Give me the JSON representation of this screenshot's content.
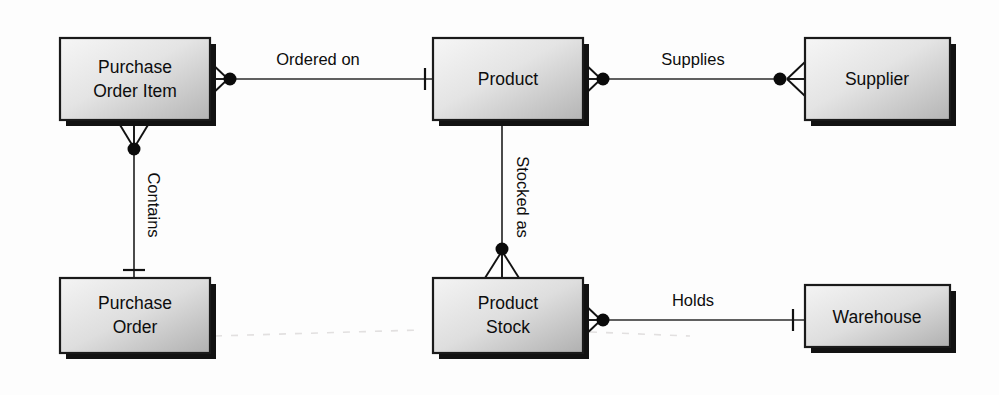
{
  "diagram": {
    "notation": "crow's foot",
    "background_color": "#fdfdfd",
    "entity_fill_light": "#f2f2f2",
    "entity_fill_dark": "#b8b8b8",
    "line_color": "#2b2b2b",
    "text_color": "#0d0d0d"
  },
  "entities": [
    {
      "id": "purchase-order-item",
      "label_lines": [
        "Purchase",
        "Order Item"
      ],
      "line1": "Purchase",
      "line2": "Order Item",
      "x": 60,
      "y": 38,
      "w": 150,
      "h": 82
    },
    {
      "id": "product",
      "label_lines": [
        "Product"
      ],
      "line1": "Product",
      "line2": "",
      "x": 433,
      "y": 38,
      "w": 150,
      "h": 82
    },
    {
      "id": "supplier",
      "label_lines": [
        "Supplier"
      ],
      "line1": "Supplier",
      "line2": "",
      "x": 805,
      "y": 38,
      "w": 145,
      "h": 82
    },
    {
      "id": "purchase-order",
      "label_lines": [
        "Purchase",
        "Order"
      ],
      "line1": "Purchase",
      "line2": "Order",
      "x": 60,
      "y": 278,
      "w": 150,
      "h": 75
    },
    {
      "id": "product-stock",
      "label_lines": [
        "Product",
        "Stock"
      ],
      "line1": "Product",
      "line2": "Stock",
      "x": 433,
      "y": 278,
      "w": 150,
      "h": 75
    },
    {
      "id": "warehouse",
      "label_lines": [
        "Warehouse"
      ],
      "line1": "Warehouse",
      "line2": "",
      "x": 805,
      "y": 285,
      "w": 145,
      "h": 62
    }
  ],
  "relationships": [
    {
      "id": "ordered-on",
      "label": "Ordered on",
      "from": "purchase-order-item",
      "to": "product",
      "orientation": "horizontal",
      "from_cardinality": "many-optional",
      "to_cardinality": "one"
    },
    {
      "id": "supplies",
      "label": "Supplies",
      "from": "product",
      "to": "supplier",
      "orientation": "horizontal",
      "from_cardinality": "many-optional",
      "to_cardinality": "many-optional"
    },
    {
      "id": "contains",
      "label": "Contains",
      "from": "purchase-order-item",
      "to": "purchase-order",
      "orientation": "vertical",
      "from_cardinality": "many-optional",
      "to_cardinality": "one"
    },
    {
      "id": "stocked-as",
      "label": "Stocked as",
      "from": "product",
      "to": "product-stock",
      "orientation": "vertical",
      "from_cardinality": "plain",
      "to_cardinality": "many-optional"
    },
    {
      "id": "holds",
      "label": "Holds",
      "from": "product-stock",
      "to": "warehouse",
      "orientation": "horizontal",
      "from_cardinality": "many-optional",
      "to_cardinality": "one"
    }
  ]
}
